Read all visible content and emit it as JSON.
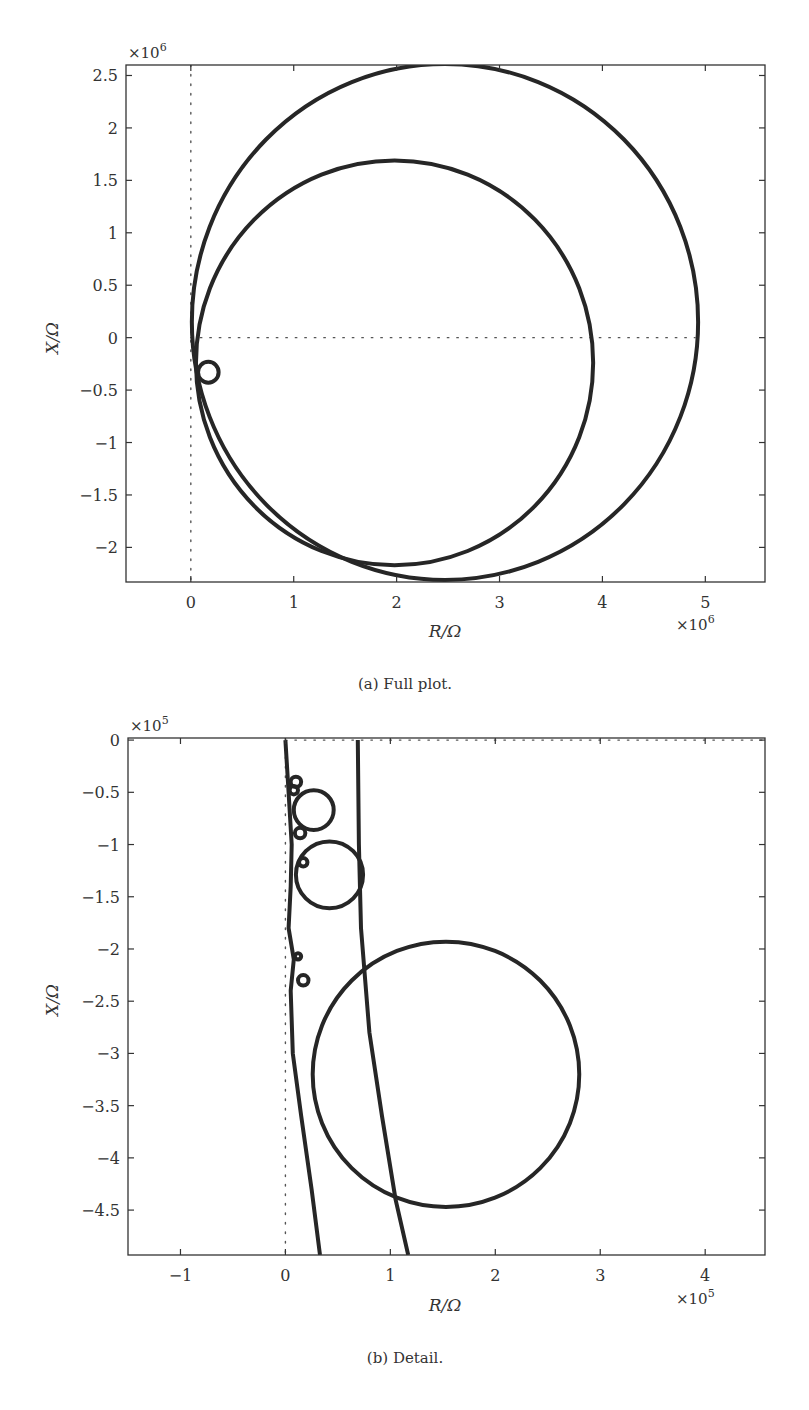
{
  "figure": {
    "panels": [
      {
        "id": "a",
        "caption": "(a) Full plot.",
        "xlabel": "R/Ω",
        "ylabel": "X/Ω",
        "x_multiplier": "×10",
        "x_multiplier_exp": "6",
        "y_multiplier": "×10",
        "y_multiplier_exp": "6",
        "xticks": [
          "0",
          "1",
          "2",
          "3",
          "4",
          "5"
        ],
        "yticks": [
          "2.5",
          "2",
          "1.5",
          "1",
          "0.5",
          "0",
          "−0.5",
          "−1",
          "−1.5",
          "−2"
        ]
      },
      {
        "id": "b",
        "caption": "(b) Detail.",
        "xlabel": "R/Ω",
        "ylabel": "X/Ω",
        "x_multiplier": "×10",
        "x_multiplier_exp": "5",
        "y_multiplier": "×10",
        "y_multiplier_exp": "5",
        "xticks": [
          "−1",
          "0",
          "1",
          "2",
          "3",
          "4"
        ],
        "yticks": [
          "0",
          "−0.5",
          "−1",
          "−1.5",
          "−2",
          "−2.5",
          "−3",
          "−3.5",
          "−4",
          "−4.5"
        ]
      }
    ]
  },
  "chart_data": [
    {
      "type": "line",
      "title": "(a) Full plot.",
      "xlabel": "R/Ω (×10^6)",
      "ylabel": "X/Ω (×10^6)",
      "xlim": [
        -0.63,
        5.58
      ],
      "ylim": [
        -2.33,
        2.6
      ],
      "xticks": [
        0,
        1,
        2,
        3,
        4,
        5
      ],
      "yticks": [
        2.5,
        2,
        1.5,
        1,
        0.5,
        0,
        -0.5,
        -1,
        -1.5,
        -2
      ],
      "grid": false,
      "reference_lines": [
        {
          "type": "vertical",
          "x": 0,
          "style": "dotted"
        },
        {
          "type": "horizontal",
          "y": 0,
          "x_from": 0,
          "x_to": 4.9,
          "style": "dotted"
        }
      ],
      "series": [
        {
          "name": "large circle",
          "shape": "circle",
          "center": [
            2.47,
            0.15
          ],
          "radius": 2.46
        },
        {
          "name": "medium circle",
          "shape": "circle",
          "center": [
            1.98,
            -0.24
          ],
          "radius": 1.93
        },
        {
          "name": "small circle",
          "shape": "circle",
          "center": [
            0.17,
            -0.33
          ],
          "radius": 0.1
        }
      ]
    },
    {
      "type": "line",
      "title": "(b) Detail.",
      "xlabel": "R/Ω (×10^5)",
      "ylabel": "X/Ω (×10^5)",
      "xlim": [
        -1.5,
        4.57
      ],
      "ylim": [
        -4.93,
        0.02
      ],
      "xticks": [
        -1,
        0,
        1,
        2,
        3,
        4
      ],
      "yticks": [
        0,
        -0.5,
        -1,
        -1.5,
        -2,
        -2.5,
        -3,
        -3.5,
        -4,
        -4.5
      ],
      "grid": false,
      "reference_lines": [
        {
          "type": "vertical",
          "x": 0,
          "style": "dotted"
        },
        {
          "type": "horizontal",
          "y": 0,
          "x_from": 0,
          "x_to": 4.57,
          "style": "dotted"
        }
      ],
      "series": [
        {
          "name": "large circle",
          "shape": "circle",
          "center": [
            1.53,
            -3.2
          ],
          "radius": 1.27
        },
        {
          "name": "loop 1",
          "shape": "circle",
          "center": [
            0.27,
            -0.67
          ],
          "radius": 0.19
        },
        {
          "name": "loop 2",
          "shape": "circle",
          "center": [
            0.42,
            -1.29
          ],
          "radius": 0.32
        },
        {
          "name": "tiny loop a",
          "shape": "circle",
          "center": [
            0.1,
            -0.4
          ],
          "radius": 0.05
        },
        {
          "name": "tiny loop b",
          "shape": "circle",
          "center": [
            0.08,
            -0.48
          ],
          "radius": 0.04
        },
        {
          "name": "tiny loop c",
          "shape": "circle",
          "center": [
            0.14,
            -0.89
          ],
          "radius": 0.05
        },
        {
          "name": "tiny loop d",
          "shape": "circle",
          "center": [
            0.17,
            -1.17
          ],
          "radius": 0.04
        },
        {
          "name": "tiny loop e",
          "shape": "circle",
          "center": [
            0.12,
            -2.07
          ],
          "radius": 0.03
        },
        {
          "name": "tiny loop f",
          "shape": "circle",
          "center": [
            0.17,
            -2.3
          ],
          "radius": 0.05
        },
        {
          "name": "left trace",
          "shape": "polyline",
          "points": [
            [
              0.0,
              0.0
            ],
            [
              0.03,
              -0.5
            ],
            [
              0.06,
              -1.0
            ],
            [
              0.05,
              -1.4
            ],
            [
              0.03,
              -1.8
            ],
            [
              0.08,
              -2.1
            ],
            [
              0.05,
              -2.4
            ],
            [
              0.07,
              -3.0
            ],
            [
              0.15,
              -3.6
            ],
            [
              0.25,
              -4.3
            ],
            [
              0.33,
              -4.93
            ]
          ]
        },
        {
          "name": "medium circle arc",
          "shape": "polyline",
          "points": [
            [
              0.69,
              0.0
            ],
            [
              0.7,
              -1.0
            ],
            [
              0.72,
              -1.8
            ],
            [
              0.8,
              -2.8
            ],
            [
              0.92,
              -3.6
            ],
            [
              1.05,
              -4.4
            ],
            [
              1.17,
              -4.93
            ]
          ]
        }
      ]
    }
  ]
}
